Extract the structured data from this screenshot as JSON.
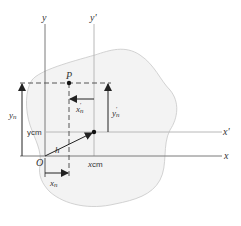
{
  "diagram": {
    "type": "coordinate-geometry / parallel-axis theorem illustration",
    "colors": {
      "body_fill": "#f3f3f3",
      "body_outline": "#c8c8c8",
      "axis_primary": "#7a7a7a",
      "axis_secondary": "#b8b8b8",
      "arrow": "#222222",
      "text": "#333333"
    },
    "axes": {
      "y_label": "y",
      "y_prime_label": "y'",
      "x_label": "x",
      "x_prime_label": "x'"
    },
    "points": {
      "origin_label": "O",
      "point_p_label": "P",
      "centroid_label": "C"
    },
    "vectors": {
      "h_label": "h"
    },
    "dimensions": {
      "y_n": {
        "base": "y",
        "sub": "n"
      },
      "y_cm": {
        "base": "y",
        "sub": "cm"
      },
      "x_cm": {
        "base": "x",
        "sub": "cm"
      },
      "x_n": {
        "base": "x",
        "sub": "n"
      },
      "x_n_prime": {
        "base": "x",
        "sub": "n",
        "prime": "'"
      },
      "y_n_prime": {
        "base": "y",
        "sub": "n",
        "prime": "'"
      }
    }
  }
}
